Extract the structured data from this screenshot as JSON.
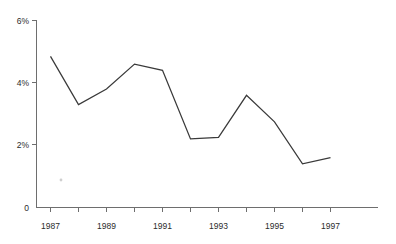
{
  "chart_data": {
    "type": "line",
    "title": "",
    "subtitle": "",
    "xlabel": "",
    "ylabel": "",
    "grid": false,
    "legend": false,
    "legend_position": "none",
    "line_color": "#3a3a3a",
    "axis_color": "#6e6e6e",
    "background_color": "#ffffff",
    "x": [
      1987,
      1988,
      1989,
      1990,
      1991,
      1992,
      1993,
      1994,
      1995,
      1996,
      1997
    ],
    "values": [
      4.85,
      3.3,
      3.8,
      4.6,
      4.4,
      2.2,
      2.25,
      3.6,
      2.75,
      1.4,
      1.6
    ],
    "xlim": [
      1987,
      1997
    ],
    "ylim": [
      0,
      6
    ],
    "y_ticks": [
      0,
      2,
      4,
      6
    ],
    "y_tick_labels": [
      "0",
      "2%",
      "4%",
      "6%"
    ],
    "x_ticks": [
      1987,
      1988,
      1989,
      1990,
      1991,
      1992,
      1993,
      1994,
      1995,
      1996,
      1997
    ],
    "x_tick_labels": [
      "1987",
      "",
      "1989",
      "",
      "1991",
      "",
      "1993",
      "",
      "1995",
      "",
      "1997"
    ],
    "annotations": []
  },
  "axis": {
    "y_label_0": "0",
    "y_label_2": "2%",
    "y_label_4": "4%",
    "y_label_6": "6%",
    "x_label_1987": "1987",
    "x_label_1989": "1989",
    "x_label_1991": "1991",
    "x_label_1993": "1993",
    "x_label_1995": "1995",
    "x_label_1997": "1997"
  }
}
